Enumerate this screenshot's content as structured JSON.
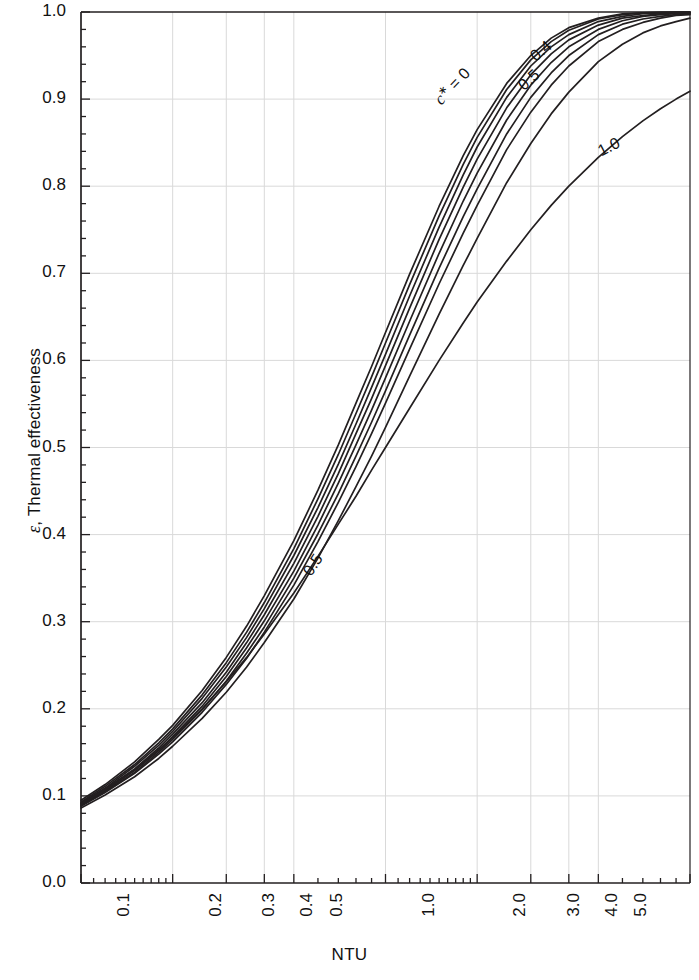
{
  "chart_data": {
    "type": "line",
    "title": "",
    "xlabel": "NTU",
    "ylabel": "ε, Thermal effectiveness",
    "ylabel_symbol": "ε",
    "ylabel_rest": ", Thermal effectiveness",
    "xscale": "log",
    "yscale": "linear",
    "xlim": [
      0.1,
      10.0
    ],
    "ylim": [
      0.0,
      1.0
    ],
    "grid": true,
    "legend": "inline-curve-labels",
    "x_ticks": [
      "0.1",
      "0.2",
      "0.3",
      "0.4",
      "0.5",
      "1.0",
      "2.0",
      "3.0",
      "4.0",
      "5.0",
      "10.0"
    ],
    "x_tick_values": [
      0.1,
      0.2,
      0.3,
      0.4,
      0.5,
      1.0,
      2.0,
      3.0,
      4.0,
      5.0,
      10.0
    ],
    "y_ticks": [
      "0.0",
      "0.1",
      "0.2",
      "0.3",
      "0.4",
      "0.5",
      "0.6",
      "0.7",
      "0.8",
      "0.9",
      "1.0"
    ],
    "y_tick_values": [
      0.0,
      0.1,
      0.2,
      0.3,
      0.4,
      0.5,
      0.6,
      0.7,
      0.8,
      0.9,
      1.0
    ],
    "y_minor_step": 0.02,
    "x": [
      0.1,
      0.12,
      0.15,
      0.18,
      0.2,
      0.25,
      0.3,
      0.35,
      0.4,
      0.5,
      0.6,
      0.7,
      0.8,
      0.9,
      1.0,
      1.2,
      1.5,
      1.8,
      2.0,
      2.5,
      3.0,
      3.5,
      4.0,
      5.0,
      6.0,
      7.0,
      8.0,
      9.0,
      10.0
    ],
    "series": [
      {
        "name": "0",
        "label": "c* = 0",
        "c_star": 0.0,
        "values": [
          0.095,
          0.113,
          0.139,
          0.165,
          0.181,
          0.221,
          0.259,
          0.295,
          0.33,
          0.393,
          0.451,
          0.503,
          0.551,
          0.593,
          0.632,
          0.699,
          0.777,
          0.835,
          0.865,
          0.918,
          0.95,
          0.97,
          0.982,
          0.993,
          0.998,
          0.999,
          1.0,
          1.0,
          1.0
        ]
      },
      {
        "name": "0.1",
        "c_star": 0.1,
        "values": [
          0.093,
          0.111,
          0.136,
          0.161,
          0.177,
          0.216,
          0.253,
          0.288,
          0.322,
          0.384,
          0.441,
          0.492,
          0.539,
          0.581,
          0.62,
          0.687,
          0.766,
          0.825,
          0.856,
          0.911,
          0.945,
          0.966,
          0.979,
          0.992,
          0.997,
          0.999,
          0.999,
          1.0,
          1.0
        ]
      },
      {
        "name": "0.2",
        "c_star": 0.2,
        "values": [
          0.092,
          0.109,
          0.134,
          0.158,
          0.174,
          0.212,
          0.248,
          0.282,
          0.315,
          0.376,
          0.431,
          0.481,
          0.527,
          0.569,
          0.607,
          0.674,
          0.753,
          0.813,
          0.845,
          0.902,
          0.938,
          0.96,
          0.974,
          0.989,
          0.995,
          0.998,
          0.999,
          0.999,
          1.0
        ]
      },
      {
        "name": "0.3",
        "c_star": 0.3,
        "values": [
          0.091,
          0.108,
          0.131,
          0.155,
          0.171,
          0.207,
          0.242,
          0.276,
          0.308,
          0.367,
          0.421,
          0.47,
          0.516,
          0.556,
          0.594,
          0.66,
          0.739,
          0.799,
          0.831,
          0.89,
          0.928,
          0.952,
          0.968,
          0.985,
          0.993,
          0.996,
          0.998,
          0.999,
          0.999
        ]
      },
      {
        "name": "0.4",
        "label": "0.4",
        "c_star": 0.4,
        "values": [
          0.09,
          0.106,
          0.129,
          0.152,
          0.168,
          0.203,
          0.237,
          0.27,
          0.301,
          0.358,
          0.411,
          0.459,
          0.503,
          0.543,
          0.58,
          0.645,
          0.723,
          0.783,
          0.815,
          0.876,
          0.916,
          0.942,
          0.96,
          0.98,
          0.99,
          0.995,
          0.997,
          0.998,
          0.999
        ]
      },
      {
        "name": "0.5",
        "label": "0.5",
        "c_star": 0.5,
        "values": [
          0.089,
          0.105,
          0.127,
          0.15,
          0.165,
          0.199,
          0.232,
          0.264,
          0.294,
          0.35,
          0.401,
          0.447,
          0.49,
          0.529,
          0.565,
          0.629,
          0.706,
          0.765,
          0.797,
          0.86,
          0.902,
          0.93,
          0.95,
          0.974,
          0.986,
          0.992,
          0.995,
          0.997,
          0.998
        ]
      },
      {
        "name": "0.6",
        "c_star": 0.6,
        "values": [
          0.088,
          0.104,
          0.126,
          0.148,
          0.162,
          0.196,
          0.228,
          0.258,
          0.288,
          0.342,
          0.392,
          0.437,
          0.478,
          0.516,
          0.551,
          0.613,
          0.688,
          0.746,
          0.778,
          0.842,
          0.885,
          0.916,
          0.938,
          0.966,
          0.98,
          0.988,
          0.993,
          0.996,
          0.997
        ]
      },
      {
        "name": "0.8",
        "c_star": 0.8,
        "values": [
          0.086,
          0.101,
          0.122,
          0.143,
          0.157,
          0.189,
          0.219,
          0.248,
          0.276,
          0.326,
          0.373,
          0.416,
          0.455,
          0.49,
          0.523,
          0.582,
          0.653,
          0.709,
          0.74,
          0.804,
          0.849,
          0.883,
          0.908,
          0.943,
          0.963,
          0.976,
          0.984,
          0.989,
          0.993
        ]
      },
      {
        "name": "1.0",
        "label": "1.0",
        "c_star": 1.0,
        "values": [
          0.091,
          0.107,
          0.13,
          0.153,
          0.167,
          0.2,
          0.231,
          0.259,
          0.286,
          0.333,
          0.375,
          0.412,
          0.444,
          0.474,
          0.5,
          0.545,
          0.6,
          0.643,
          0.667,
          0.714,
          0.75,
          0.778,
          0.8,
          0.833,
          0.857,
          0.875,
          0.889,
          0.9,
          0.909
        ]
      }
    ],
    "annotations": [
      {
        "text": "c* = 0",
        "near_series": "0",
        "x": 1.65,
        "y": 0.915,
        "rotation": -47
      },
      {
        "text": "0.4",
        "near_series": "0.4",
        "x": 3.25,
        "y": 0.955,
        "rotation": -40
      },
      {
        "text": "0.5",
        "near_series": "0.5",
        "x": 2.95,
        "y": 0.922,
        "rotation": -42
      },
      {
        "text": "0.5",
        "near_series": "0.5-left",
        "x": 0.58,
        "y": 0.365,
        "rotation": -57
      },
      {
        "text": "1.0",
        "near_series": "1.0",
        "x": 5.4,
        "y": 0.845,
        "rotation": -27
      }
    ],
    "colors": {
      "curve": "#231f20",
      "axis": "#231f20",
      "grid": "#d9d9d9",
      "background": "#ffffff",
      "text": "#111111"
    }
  }
}
